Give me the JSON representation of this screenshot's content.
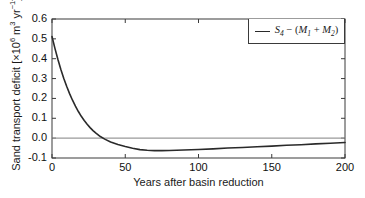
{
  "chart_data": {
    "type": "line",
    "title": "",
    "xlabel": "Years after basin reduction",
    "ylabel": "Sand transport deficit [×10⁶ m³ yr⁻¹]",
    "ylabel_parts": {
      "prefix": "Sand transport deficit [×10",
      "exp1": "6",
      "mid": " m",
      "exp2": "3",
      "unit": " yr",
      "exp3": "−1",
      "suffix": "]"
    },
    "xlim": [
      0,
      200
    ],
    "ylim": [
      -0.1,
      0.6
    ],
    "xticks": [
      0,
      50,
      100,
      150,
      200
    ],
    "xtick_labels": [
      "0",
      "50",
      "100",
      "150",
      "200"
    ],
    "yticks": [
      -0.1,
      0.0,
      0.1,
      0.2,
      0.3,
      0.4,
      0.5,
      0.6
    ],
    "ytick_labels": [
      "-0.1",
      "0.0",
      "0.1",
      "0.2",
      "0.3",
      "0.4",
      "0.5",
      "0.6"
    ],
    "grid": false,
    "legend_position": "top-right",
    "zero_line": {
      "value": 0.0,
      "color": "#9a9a9a",
      "width": 1.2
    },
    "series": [
      {
        "name": "S_4 - (M_1 + M_2)",
        "legend_label_parts": {
          "s": "S",
          "s_sub": "4",
          "minus": " − (",
          "m1": "M",
          "m1_sub": "1",
          "plus": " + ",
          "m2": "M",
          "m2_sub": "2",
          "close": ")"
        },
        "color": "#2a2a2a",
        "width": 1.6,
        "x": [
          0,
          2,
          4,
          6,
          8,
          10,
          12,
          14,
          16,
          18,
          20,
          22,
          24,
          26,
          28,
          30,
          33,
          36,
          40,
          45,
          50,
          55,
          60,
          65,
          70,
          75,
          80,
          90,
          100,
          110,
          120,
          130,
          140,
          150,
          160,
          170,
          180,
          190,
          200
        ],
        "y": [
          0.512,
          0.452,
          0.397,
          0.347,
          0.302,
          0.261,
          0.224,
          0.191,
          0.161,
          0.134,
          0.11,
          0.089,
          0.07,
          0.053,
          0.038,
          0.025,
          0.008,
          -0.005,
          -0.019,
          -0.032,
          -0.042,
          -0.051,
          -0.058,
          -0.061,
          -0.063,
          -0.063,
          -0.062,
          -0.06,
          -0.057,
          -0.054,
          -0.05,
          -0.047,
          -0.043,
          -0.04,
          -0.036,
          -0.033,
          -0.029,
          -0.026,
          -0.022
        ]
      }
    ],
    "annotations": {
      "zero_crossing_year": 24,
      "minimum_year": 72,
      "minimum_value": -0.063,
      "start_value": 0.512,
      "end_value": -0.022
    }
  },
  "axes": {
    "box_color": "#3a3a3a",
    "background": "#ffffff"
  }
}
